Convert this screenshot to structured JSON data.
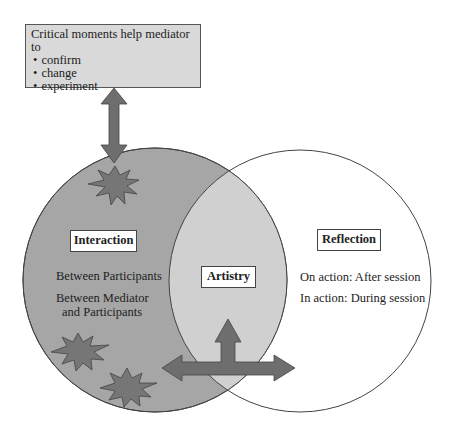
{
  "callout": {
    "title": "Critical moments help mediator to",
    "items": [
      "confirm",
      "change",
      "experiment"
    ]
  },
  "interaction": {
    "label": "Interaction",
    "line1": "Between Participants",
    "line2a": "Between Mediator",
    "line2b": "and Participants"
  },
  "artistry": {
    "label": "Artistry"
  },
  "reflection": {
    "label": "Reflection",
    "line1": "On action: After session",
    "line2": "In action: During session"
  },
  "colors": {
    "left_circle": "#a6a6a6",
    "overlap": "#d0d0d0",
    "arrow": "#6e6e6e",
    "star": "#767676",
    "callout_bg": "#d9d9d9"
  }
}
